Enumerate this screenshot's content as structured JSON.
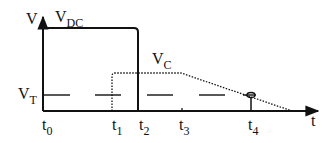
{
  "diagram": {
    "y_axis_label": "V",
    "x_axis_label": "t",
    "curves": {
      "vdc": {
        "name": "V",
        "subscript": "DC",
        "style": "solid"
      },
      "vc": {
        "name": "V",
        "subscript": "C",
        "style": "dotted"
      },
      "vt": {
        "name": "V",
        "subscript": "T",
        "style": "dashed"
      }
    },
    "time_marks": [
      {
        "name": "t",
        "subscript": "0"
      },
      {
        "name": "t",
        "subscript": "1"
      },
      {
        "name": "t",
        "subscript": "2"
      },
      {
        "name": "t",
        "subscript": "3"
      },
      {
        "name": "t",
        "subscript": "4"
      }
    ],
    "colors": {
      "ink": "#111111",
      "background": "#ffffff"
    }
  }
}
